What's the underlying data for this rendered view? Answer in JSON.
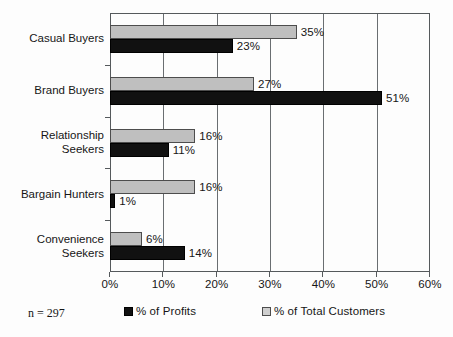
{
  "chart_data": {
    "type": "bar",
    "orientation": "horizontal",
    "title": "",
    "xlabel": "",
    "ylabel": "",
    "xlim": [
      0,
      60
    ],
    "xticks": [
      "0%",
      "10%",
      "20%",
      "30%",
      "40%",
      "50%",
      "60%"
    ],
    "xtick_values": [
      0,
      10,
      20,
      30,
      40,
      50,
      60
    ],
    "grid": true,
    "legend_position": "bottom",
    "categories": [
      "Casual Buyers",
      "Brand Buyers",
      "Relationship\nSeekers",
      "Bargain Hunters",
      "Convenience\nSeekers"
    ],
    "series": [
      {
        "name": "% of Total Customers",
        "color": "#bfbfbf",
        "values": [
          35,
          27,
          16,
          16,
          6
        ],
        "labels": [
          "35%",
          "27%",
          "16%",
          "16%",
          "6%"
        ]
      },
      {
        "name": "% of Profits",
        "color": "#111111",
        "values": [
          23,
          51,
          11,
          1,
          14
        ],
        "labels": [
          "23%",
          "51%",
          "11%",
          "1%",
          "14%"
        ]
      }
    ],
    "annotations": {
      "sample_size": "n = 297"
    }
  },
  "legend": {
    "items": [
      {
        "label": "% of Profits",
        "swatch": "black-square-swatch"
      },
      {
        "label": "% of Total Customers",
        "swatch": "gray-square-swatch"
      }
    ]
  }
}
